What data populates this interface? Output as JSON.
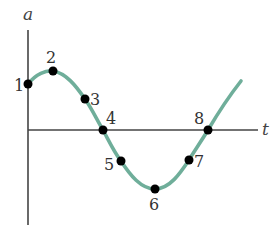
{
  "diagram": {
    "type": "sinusoidal acceleration vs time graph",
    "axes": {
      "y_label": "a",
      "x_label": "t"
    },
    "curve_color": "#6fae9a",
    "axis_color": "#444444",
    "points": [
      {
        "label": "1",
        "x": 28,
        "y": 84,
        "lx": 14,
        "ly": 91
      },
      {
        "label": "2",
        "x": 53,
        "y": 71,
        "lx": 46,
        "ly": 63
      },
      {
        "label": "3",
        "x": 85,
        "y": 99,
        "lx": 90,
        "ly": 105
      },
      {
        "label": "4",
        "x": 103,
        "y": 130,
        "lx": 106,
        "ly": 124
      },
      {
        "label": "5",
        "x": 121,
        "y": 161,
        "lx": 104,
        "ly": 170
      },
      {
        "label": "6",
        "x": 155,
        "y": 189,
        "lx": 149,
        "ly": 210
      },
      {
        "label": "7",
        "x": 189,
        "y": 160,
        "lx": 194,
        "ly": 167
      },
      {
        "label": "8",
        "x": 208,
        "y": 130,
        "lx": 194,
        "ly": 124
      }
    ]
  }
}
